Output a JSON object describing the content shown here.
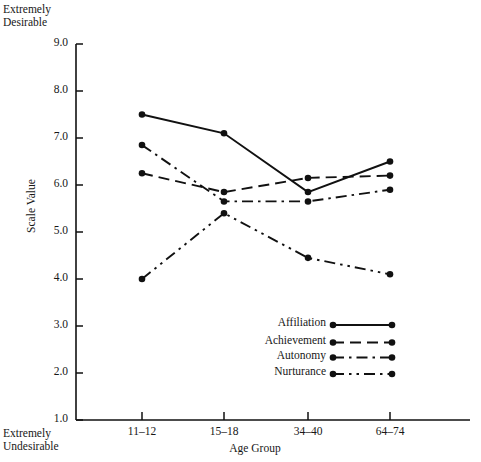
{
  "annotations": {
    "top_left_line1": "Extremely",
    "top_left_line2": "Desirable",
    "bottom_left_line1": "Extremely",
    "bottom_left_line2": "Undesirable"
  },
  "chart_data": {
    "type": "line",
    "title": "",
    "xlabel": "Age Group",
    "ylabel": "Scale Value",
    "categories": [
      "11–12",
      "15–18",
      "34–40",
      "64–74"
    ],
    "ylim": [
      1.0,
      9.0
    ],
    "yticks": [
      "9.0",
      "8.0",
      "7.0",
      "6.0",
      "5.0",
      "4.0",
      "3.0",
      "2.0",
      "1.0"
    ],
    "ytick_values": [
      9.0,
      8.0,
      7.0,
      6.0,
      5.0,
      4.0,
      3.0,
      2.0,
      1.0
    ],
    "grid": false,
    "legend_position": "inside-lower-center",
    "series": [
      {
        "name": "Affiliation",
        "style": "solid",
        "values": [
          7.5,
          7.1,
          5.85,
          6.5
        ]
      },
      {
        "name": "Achievement",
        "style": "dashed",
        "values": [
          6.25,
          5.85,
          6.15,
          6.2
        ]
      },
      {
        "name": "Autonomy",
        "style": "dash-dot",
        "values": [
          6.85,
          5.65,
          5.65,
          5.9
        ]
      },
      {
        "name": "Nurturance",
        "style": "dash-dot-dot",
        "values": [
          4.0,
          5.4,
          4.45,
          4.1
        ]
      }
    ],
    "axis_note_high": "Extremely Desirable",
    "axis_note_low": "Extremely Undesirable",
    "line_color": "#111111"
  }
}
